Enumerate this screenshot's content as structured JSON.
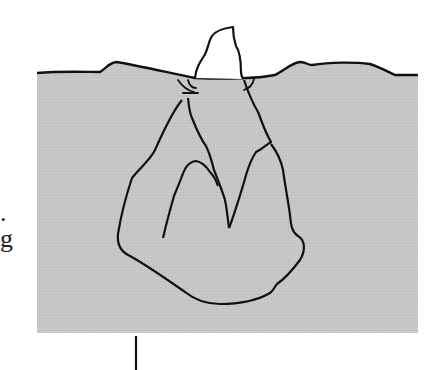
{
  "figure": {
    "colors": {
      "water": "#c4c4c4",
      "sky": "#ffffff",
      "line": "#111111"
    }
  },
  "margin_text": {
    "fragment_1": ".",
    "fragment_2": "g"
  }
}
